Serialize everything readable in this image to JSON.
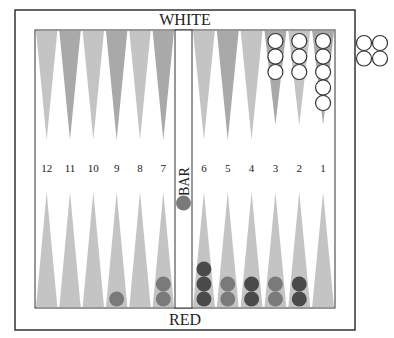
{
  "labels": {
    "top": "WHITE",
    "bottom": "RED",
    "bar": "BAR"
  },
  "point_numbers": [
    "12",
    "11",
    "10",
    "9",
    "8",
    "7",
    "6",
    "5",
    "4",
    "3",
    "2",
    "1"
  ],
  "colors": {
    "board_border": "#333333",
    "point_dark": "#a9a9a9",
    "point_light": "#c4c4c4",
    "white_checker_fill": "#ffffff",
    "white_checker_stroke": "#333333",
    "red_checker": "#7a7a7a",
    "red_checker_dark": "#4a4a4a"
  },
  "top_points": [
    {
      "label": "13",
      "white": 0
    },
    {
      "label": "14",
      "white": 0
    },
    {
      "label": "15",
      "white": 0
    },
    {
      "label": "16",
      "white": 0
    },
    {
      "label": "17",
      "white": 0
    },
    {
      "label": "18",
      "white": 0
    },
    {
      "label": "19",
      "white": 0
    },
    {
      "label": "20",
      "white": 0
    },
    {
      "label": "21",
      "white": 0
    },
    {
      "label": "22",
      "white": 3
    },
    {
      "label": "23",
      "white": 3
    },
    {
      "label": "24",
      "white": 5
    }
  ],
  "bottom_points": [
    {
      "label": "12",
      "red": 0,
      "shade": "light"
    },
    {
      "label": "11",
      "red": 0,
      "shade": "light"
    },
    {
      "label": "10",
      "red": 0,
      "shade": "light"
    },
    {
      "label": "9",
      "red": 1,
      "shade": "light"
    },
    {
      "label": "8",
      "red": 0,
      "shade": "light"
    },
    {
      "label": "7",
      "red": 2,
      "shade": "light"
    },
    {
      "label": "6",
      "red": 3,
      "shade": "dark"
    },
    {
      "label": "5",
      "red": 2,
      "shade": "light"
    },
    {
      "label": "4",
      "red": 2,
      "shade": "dark"
    },
    {
      "label": "3",
      "red": 2,
      "shade": "light"
    },
    {
      "label": "2",
      "red": 2,
      "shade": "dark"
    },
    {
      "label": "1",
      "red": 0,
      "shade": "light"
    }
  ],
  "bar": {
    "red": 1,
    "white": 0
  },
  "borne_off": {
    "white": 4,
    "red": 0
  }
}
